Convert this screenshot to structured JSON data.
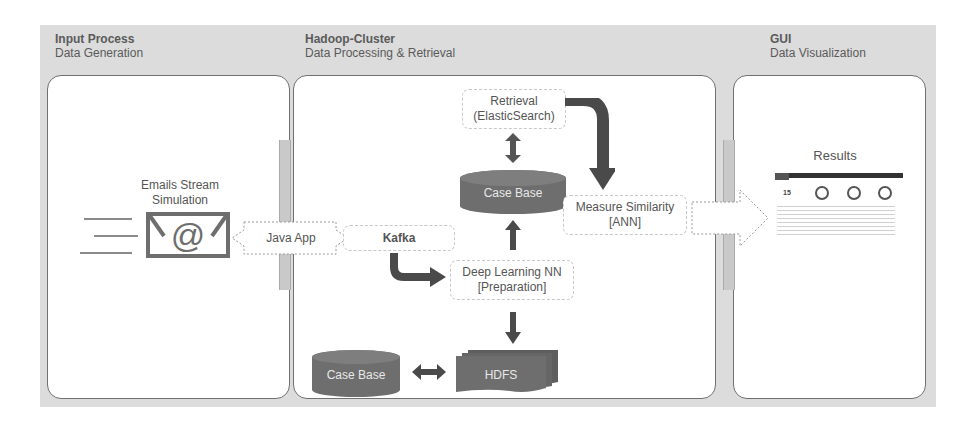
{
  "sections": [
    {
      "title": "Input Process",
      "subtitle": "Data Generation"
    },
    {
      "title": "Hadoop-Cluster",
      "subtitle": "Data Processing & Retrieval"
    },
    {
      "title": "GUI",
      "subtitle": "Data Visualization"
    }
  ],
  "input": {
    "email_label_line1": "Emails Stream",
    "email_label_line2": "Simulation",
    "email_icon": "email-at-icon"
  },
  "connectors": {
    "java_app": "Java App"
  },
  "cluster": {
    "retrieval_line1": "Retrieval",
    "retrieval_line2": "(ElasticSearch)",
    "case_base_top": "Case Base",
    "measure_line1": "Measure Similarity",
    "measure_line2": "[ANN]",
    "kafka": "Kafka",
    "dl_line1": "Deep Learning NN",
    "dl_line2": "[Preparation]",
    "case_base_bottom": "Case Base",
    "hdfs": "HDFS"
  },
  "gui": {
    "results_label": "Results",
    "dashboard_kpi": "15"
  },
  "colors": {
    "panel_bg": "#dcdcdc",
    "box_border": "#707070",
    "dark_shape": "#6e6e6e",
    "arrow": "#4a4a4a",
    "text": "#555555"
  }
}
